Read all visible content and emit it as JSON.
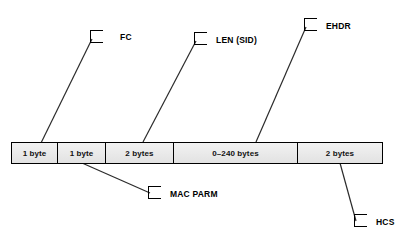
{
  "diagram": {
    "bar": {
      "fields": [
        {
          "id": "fc",
          "size_label": "1 byte",
          "width_px": 46
        },
        {
          "id": "mac_parm",
          "size_label": "1 byte",
          "width_px": 48
        },
        {
          "id": "len_sid",
          "size_label": "2 bytes",
          "width_px": 68
        },
        {
          "id": "ehdr",
          "size_label": "0–240 bytes",
          "width_px": 124
        },
        {
          "id": "hcs",
          "size_label": "2 bytes",
          "width_px": 86
        }
      ]
    },
    "callouts": [
      {
        "id": "fc",
        "label": "FC",
        "position": "top"
      },
      {
        "id": "len_sid",
        "label": "LEN (SID)",
        "position": "top"
      },
      {
        "id": "ehdr",
        "label": "EHDR",
        "position": "top"
      },
      {
        "id": "mac_parm",
        "label": "MAC PARM",
        "position": "bottom"
      },
      {
        "id": "hcs",
        "label": "HCS",
        "position": "bottom"
      }
    ],
    "colors": {
      "line": "#2b2b2b",
      "fill": "#e9e9e9",
      "text": "#000000"
    }
  }
}
